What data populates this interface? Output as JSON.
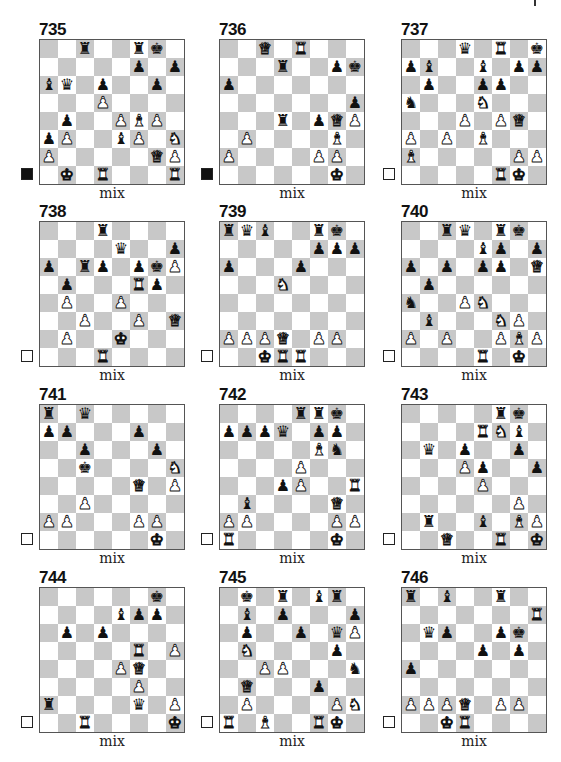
{
  "page": {
    "colors": {
      "dark_square": "#c8c8c8",
      "light_square": "#ffffff",
      "border": "#555555"
    }
  },
  "puzzles": [
    {
      "number": "735",
      "caption": "mix",
      "to_move": "black",
      "pieces": {
        "c8": "r",
        "f8": "r",
        "g8": "k",
        "f7": "p",
        "h7": "p",
        "a6": "b",
        "b6": "q",
        "d6": "p",
        "g6": "p",
        "d5": "P",
        "b4": "p",
        "e4": "P",
        "f4": "B",
        "g4": "P",
        "a3": "p",
        "b3": "P",
        "e3": "b",
        "f3": "P",
        "h3": "N",
        "a2": "P",
        "g2": "Q",
        "h2": "P",
        "b1": "K",
        "d1": "R",
        "h1": "R"
      }
    },
    {
      "number": "736",
      "caption": "mix",
      "to_move": "black",
      "pieces": {
        "c8": "Q",
        "e8": "R",
        "d7": "r",
        "g7": "p",
        "h7": "k",
        "a6": "p",
        "h5": "p",
        "d4": "r",
        "f4": "p",
        "g4": "Q",
        "h4": "P",
        "b3": "P",
        "g3": "B",
        "a2": "P",
        "f2": "P",
        "g2": "P",
        "g1": "K"
      }
    },
    {
      "number": "737",
      "caption": "mix",
      "to_move": "white",
      "pieces": {
        "d8": "q",
        "f8": "R",
        "h8": "k",
        "a7": "p",
        "b7": "b",
        "e7": "b",
        "g7": "p",
        "h7": "p",
        "b6": "p",
        "e6": "p",
        "f6": "p",
        "a5": "n",
        "e5": "N",
        "d4": "P",
        "f4": "P",
        "g4": "Q",
        "a3": "P",
        "c3": "P",
        "e3": "B",
        "a2": "B",
        "g2": "P",
        "h2": "P",
        "f1": "R",
        "g1": "K"
      }
    },
    {
      "number": "738",
      "caption": "mix",
      "to_move": "white",
      "pieces": {
        "d8": "r",
        "e7": "q",
        "h7": "p",
        "a6": "p",
        "c6": "r",
        "d6": "p",
        "f6": "p",
        "g6": "k",
        "h6": "P",
        "b5": "p",
        "f5": "R",
        "g5": "p",
        "b4": "P",
        "e4": "P",
        "c3": "P",
        "f3": "P",
        "h3": "Q",
        "b2": "P",
        "e2": "K",
        "d1": "R"
      }
    },
    {
      "number": "739",
      "caption": "mix",
      "to_move": "white",
      "pieces": {
        "a8": "r",
        "b8": "q",
        "c8": "b",
        "f8": "r",
        "g8": "k",
        "f7": "p",
        "g7": "p",
        "h7": "p",
        "a6": "p",
        "e6": "p",
        "d5": "N",
        "a2": "P",
        "b2": "P",
        "c2": "P",
        "d2": "Q",
        "f2": "P",
        "g2": "P",
        "c1": "K",
        "d1": "R",
        "e1": "R"
      }
    },
    {
      "number": "740",
      "caption": "mix",
      "to_move": "white",
      "pieces": {
        "c8": "r",
        "d8": "q",
        "f8": "r",
        "g8": "k",
        "e7": "b",
        "f7": "p",
        "h7": "p",
        "a6": "p",
        "c6": "p",
        "e6": "p",
        "f6": "p",
        "h6": "Q",
        "b5": "p",
        "a4": "n",
        "d4": "P",
        "e4": "N",
        "b3": "b",
        "f3": "N",
        "g3": "P",
        "a2": "P",
        "c2": "P",
        "f2": "P",
        "g2": "B",
        "h2": "P",
        "e1": "R",
        "g1": "K"
      }
    },
    {
      "number": "741",
      "caption": "mix",
      "to_move": "white",
      "pieces": {
        "a8": "r",
        "c8": "q",
        "a7": "p",
        "b7": "p",
        "f7": "p",
        "c6": "p",
        "g6": "p",
        "c5": "k",
        "h5": "N",
        "f4": "Q",
        "h4": "P",
        "c3": "P",
        "a2": "P",
        "b2": "P",
        "f2": "P",
        "g2": "P",
        "g1": "K"
      }
    },
    {
      "number": "742",
      "caption": "mix",
      "to_move": "white",
      "pieces": {
        "e8": "r",
        "f8": "r",
        "g8": "k",
        "a7": "p",
        "b7": "p",
        "c7": "p",
        "d7": "q",
        "f7": "p",
        "g7": "p",
        "f6": "B",
        "g6": "n",
        "e5": "P",
        "d4": "p",
        "e4": "P",
        "h4": "R",
        "b3": "b",
        "g3": "Q",
        "a2": "P",
        "b2": "P",
        "g2": "P",
        "h2": "P",
        "a1": "R",
        "g1": "K"
      }
    },
    {
      "number": "743",
      "caption": "mix",
      "to_move": "white",
      "pieces": {
        "f8": "r",
        "g8": "k",
        "e7": "R",
        "f7": "N",
        "g7": "b",
        "b6": "q",
        "d6": "p",
        "g6": "p",
        "d5": "P",
        "e5": "p",
        "h5": "p",
        "e4": "P",
        "g3": "P",
        "b2": "r",
        "e2": "b",
        "g2": "B",
        "h2": "P",
        "c1": "Q",
        "f1": "R",
        "h1": "K"
      }
    },
    {
      "number": "744",
      "caption": "mix",
      "to_move": "white",
      "pieces": {
        "g8": "k",
        "e7": "b",
        "f7": "p",
        "g7": "p",
        "b6": "p",
        "d6": "p",
        "f5": "R",
        "h5": "P",
        "e4": "P",
        "f4": "Q",
        "f3": "P",
        "a2": "r",
        "f2": "q",
        "h2": "P",
        "c1": "R",
        "h1": "K"
      }
    },
    {
      "number": "745",
      "caption": "mix",
      "to_move": "white",
      "pieces": {
        "b8": "k",
        "d8": "r",
        "f8": "b",
        "g8": "r",
        "b7": "b",
        "d7": "p",
        "h7": "p",
        "b6": "p",
        "e6": "p",
        "g6": "q",
        "h6": "P",
        "b5": "N",
        "g5": "p",
        "c4": "P",
        "d4": "P",
        "h4": "n",
        "b3": "Q",
        "f3": "p",
        "b2": "P",
        "g2": "P",
        "h2": "N",
        "a1": "R",
        "c1": "B",
        "f1": "R",
        "g1": "K"
      }
    },
    {
      "number": "746",
      "caption": "mix",
      "to_move": "white",
      "pieces": {
        "a8": "r",
        "c8": "b",
        "f8": "r",
        "h7": "R",
        "b6": "q",
        "c6": "p",
        "f6": "p",
        "g6": "k",
        "e5": "p",
        "g5": "p",
        "a4": "p",
        "a2": "P",
        "b2": "P",
        "c2": "P",
        "d2": "Q",
        "f2": "P",
        "g2": "P",
        "c1": "K",
        "d1": "R"
      }
    }
  ],
  "glyphs": {
    "K": "♚",
    "Q": "♛",
    "R": "♜",
    "B": "♝",
    "N": "♞",
    "P": "♟",
    "k": "♚",
    "q": "♛",
    "r": "♜",
    "b": "♝",
    "n": "♞",
    "p": "♟"
  },
  "piece_names": {
    "k": "king",
    "q": "queen",
    "r": "rook",
    "b": "bishop",
    "n": "knight",
    "p": "pawn"
  }
}
